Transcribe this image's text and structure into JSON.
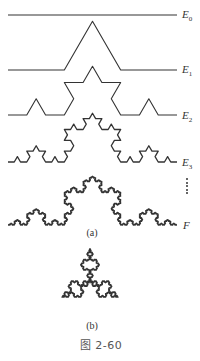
{
  "figure": {
    "title": "图 2-60",
    "stroke_color": "#333333",
    "background": "#ffffff"
  },
  "panel_a": {
    "label": "(a)",
    "curves": [
      {
        "name": "E",
        "sub": "0",
        "iterations": 0,
        "x0": 8,
        "x1": 177,
        "baseline_y": 15
      },
      {
        "name": "E",
        "sub": "1",
        "iterations": 1,
        "x0": 8,
        "x1": 177,
        "baseline_y": 70
      },
      {
        "name": "E",
        "sub": "2",
        "iterations": 2,
        "x0": 8,
        "x1": 177,
        "baseline_y": 115
      },
      {
        "name": "E",
        "sub": "3",
        "iterations": 3,
        "x0": 8,
        "x1": 177,
        "baseline_y": 162
      },
      {
        "name": "F",
        "sub": "",
        "iterations": 5,
        "x0": 8,
        "x1": 177,
        "baseline_y": 225
      }
    ],
    "ellipsis": "⋮"
  },
  "panel_b": {
    "label": "(b)",
    "shape": "Koch snowflake",
    "iterations": 4,
    "center": [
      90,
      281
    ],
    "side": 56
  }
}
